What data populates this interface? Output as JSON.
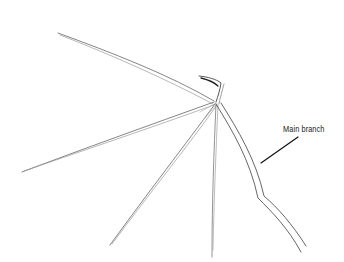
{
  "diagram": {
    "colors": {
      "background": "#ffffff",
      "stroke": "#555555",
      "stroke_light": "#9a9a9a",
      "label_line": "#111111",
      "label_text": "#222222"
    },
    "labels": [
      {
        "id": "main-branch",
        "text": "Main branch"
      }
    ]
  }
}
